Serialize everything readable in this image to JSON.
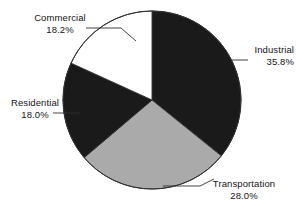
{
  "chart_data": {
    "type": "pie",
    "title": "",
    "subtitle": "",
    "xlabel": "",
    "ylabel": "",
    "legend_position": "none",
    "grid": false,
    "label_format": "name + percent",
    "start_angle_deg": 0,
    "direction": "clockwise",
    "categories": [
      "Industrial",
      "Transportation",
      "Residential",
      "Commercial"
    ],
    "values": [
      35.8,
      28.0,
      18.0,
      18.2
    ],
    "slices": [
      {
        "label": "Industrial",
        "value": 35.8,
        "value_text": "35.8%",
        "color": "#1a1a1a",
        "start_deg": 0.0,
        "end_deg": 128.88,
        "leader": "left-horizontal"
      },
      {
        "label": "Transportation",
        "value": 28.0,
        "value_text": "28.0%",
        "color": "#aaaaaa",
        "start_deg": 128.88,
        "end_deg": 229.68,
        "leader": "diagonal-up-left"
      },
      {
        "label": "Residential",
        "value": 18.0,
        "value_text": "18.0%",
        "color": "#1a1a1a",
        "start_deg": 229.68,
        "end_deg": 294.48,
        "leader": "right-horizontal"
      },
      {
        "label": "Commercial",
        "value": 18.2,
        "value_text": "18.2%",
        "color": "#ffffff",
        "start_deg": 294.48,
        "end_deg": 360.0,
        "leader": "diagonal-down-right"
      }
    ],
    "colors": {
      "dark_slice": "#1a1a1a",
      "gray_slice": "#aaaaaa",
      "white_slice": "#ffffff",
      "outline": "#303030",
      "leader_line": "#303030",
      "text": "#141414",
      "background": "#ffffff"
    }
  }
}
